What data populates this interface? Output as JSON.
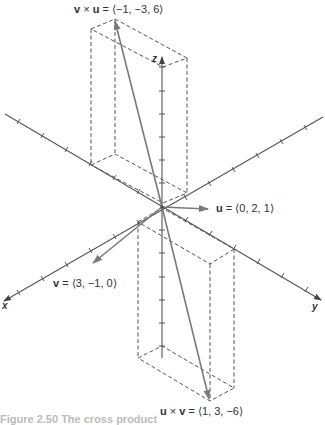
{
  "figure": {
    "axes": {
      "x_label": "x",
      "y_label": "y",
      "z_label": "z"
    },
    "vectors": [
      {
        "id": "v_cross_u",
        "name_left": "v",
        "op": "×",
        "name_right": "u",
        "value": "= ⟨−1, −3, 6⟩"
      },
      {
        "id": "u",
        "name": "u",
        "value": "= ⟨0, 2, 1⟩"
      },
      {
        "id": "v",
        "name": "v",
        "value": "= ⟨3, −1, 0⟩"
      },
      {
        "id": "u_cross_v",
        "name_left": "u",
        "op": "×",
        "name_right": "v",
        "value": "= ⟨1, 3, −6⟩"
      }
    ],
    "caption": "Figure 2.50  The cross product",
    "colors": {
      "axis": "#555555",
      "vector": "#7a7a7a",
      "dashed_box": "#555555",
      "text": "#333333"
    }
  }
}
